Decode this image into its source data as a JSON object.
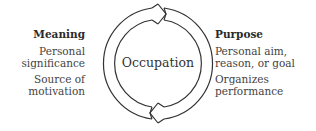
{
  "diagram": {
    "center": {
      "label": "Occupation"
    },
    "left": {
      "title": "Meaning",
      "items": [
        "Personal significance",
        "Source of motivation"
      ]
    },
    "right": {
      "title": "Purpose",
      "items": [
        "Personal aim, reason, or goal",
        "Organizes performance"
      ]
    },
    "colors": {
      "stroke": "#333333",
      "text": "#3a3a3a"
    }
  }
}
